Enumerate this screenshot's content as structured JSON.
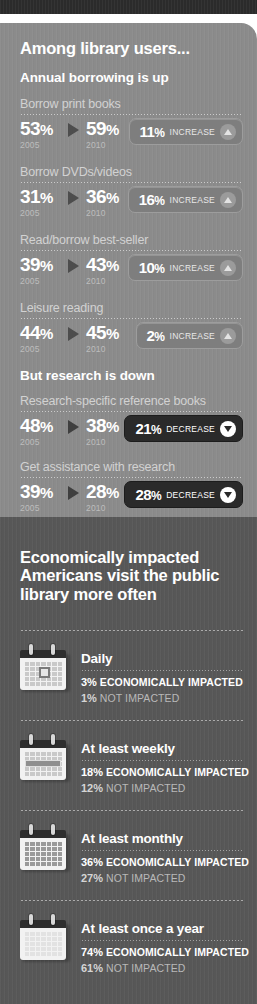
{
  "window": {
    "topbar_color": "#2b2b2b"
  },
  "theme": {
    "panel_light": "#8b8b8b",
    "panel_dark": "#575757",
    "badge_increase_bg": "#7e7e7e",
    "badge_decrease_bg": "#2a2a2a",
    "text_primary": "#ffffff",
    "text_muted": "#d2d2d2"
  },
  "section_users": {
    "title": "Among library users...",
    "sub_up": "But research is down",
    "sub_down": "Annual borrowing is up"
  },
  "chart_data": {
    "type": "bar",
    "title": "Among library users...",
    "xlabel": "",
    "ylabel": "Percent of library users",
    "ylim": [
      0,
      100
    ],
    "categories": [
      "Borrow print books",
      "Borrow DVDs/videos",
      "Read/borrow best-seller",
      "Leisure reading",
      "Research-specific reference books",
      "Get assistance with research"
    ],
    "series": [
      {
        "name": "2005",
        "values": [
          53,
          31,
          39,
          44,
          48,
          39
        ]
      },
      {
        "name": "2010",
        "values": [
          59,
          36,
          43,
          45,
          38,
          28
        ]
      }
    ],
    "change": [
      {
        "value": 11,
        "direction": "increase"
      },
      {
        "value": 16,
        "direction": "increase"
      },
      {
        "value": 10,
        "direction": "increase"
      },
      {
        "value": 2,
        "direction": "increase"
      },
      {
        "value": 21,
        "direction": "decrease"
      },
      {
        "value": 28,
        "direction": "decrease"
      }
    ],
    "legend": [
      "2005",
      "2010"
    ],
    "grid": false
  },
  "rows": [
    {
      "label": "Borrow print books",
      "from_value": "53%",
      "from_year": "2005",
      "to_value": "59%",
      "to_year": "2010",
      "badge_value": "11%",
      "badge_text": "INCREASE",
      "direction": "increase"
    },
    {
      "label": "Borrow DVDs/videos",
      "from_value": "31%",
      "from_year": "2005",
      "to_value": "36%",
      "to_year": "2010",
      "badge_value": "16%",
      "badge_text": "INCREASE",
      "direction": "increase"
    },
    {
      "label": "Read/borrow best-seller",
      "from_value": "39%",
      "from_year": "2005",
      "to_value": "43%",
      "to_year": "2010",
      "badge_value": "10%",
      "badge_text": "INCREASE",
      "direction": "increase"
    },
    {
      "label": "Leisure reading",
      "from_value": "44%",
      "from_year": "2005",
      "to_value": "45%",
      "to_year": "2010",
      "badge_value": "2%",
      "badge_text": "INCREASE",
      "direction": "increase"
    },
    {
      "label": "Research-specific reference books",
      "from_value": "48%",
      "from_year": "2005",
      "to_value": "38%",
      "to_year": "2010",
      "badge_value": "21%",
      "badge_text": "DECREASE",
      "direction": "decrease"
    },
    {
      "label": "Get assistance with research",
      "from_value": "39%",
      "from_year": "2005",
      "to_value": "28%",
      "to_year": "2010",
      "badge_value": "28%",
      "badge_text": "DECREASE",
      "direction": "decrease"
    }
  ],
  "section_visits": {
    "title": "Economically impacted Americans visit the public library more often",
    "cards": [
      {
        "title": "Daily",
        "icon": "calendar-day-icon",
        "impacted_value": "3%",
        "impacted_label": "ECONOMICALLY IMPACTED",
        "not_impacted_value": "1%",
        "not_impacted_label": "NOT IMPACTED"
      },
      {
        "title": "At least weekly",
        "icon": "calendar-week-icon",
        "impacted_value": "18%",
        "impacted_label": "ECONOMICALLY IMPACTED",
        "not_impacted_value": "12%",
        "not_impacted_label": "NOT IMPACTED"
      },
      {
        "title": "At least monthly",
        "icon": "calendar-month-icon",
        "impacted_value": "36%",
        "impacted_label": "ECONOMICALLY IMPACTED",
        "not_impacted_value": "27%",
        "not_impacted_label": "NOT IMPACTED"
      },
      {
        "title": "At least once a year",
        "icon": "calendar-year-icon",
        "impacted_value": "74%",
        "impacted_label": "ECONOMICALLY IMPACTED",
        "not_impacted_value": "61%",
        "not_impacted_label": "NOT IMPACTED"
      }
    ]
  }
}
